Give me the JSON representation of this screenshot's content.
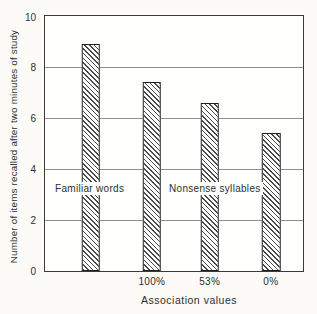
{
  "chart_data": {
    "type": "bar",
    "title": "",
    "xlabel": "Association values",
    "ylabel": "Number of items recalled after two minutes of study",
    "ylim": [
      0,
      10
    ],
    "yticks": [
      0,
      2,
      4,
      6,
      8,
      10
    ],
    "gridlines": [
      2,
      4,
      6,
      8
    ],
    "grid": "horizontal",
    "legend": "none",
    "bars": [
      {
        "group": "Familiar words",
        "x_tick_label": "",
        "value": 8.9
      },
      {
        "group": "Nonsense syllables",
        "x_tick_label": "100%",
        "value": 7.4
      },
      {
        "group": "Nonsense syllables",
        "x_tick_label": "53%",
        "value": 6.6
      },
      {
        "group": "Nonsense syllables",
        "x_tick_label": "0%",
        "value": 5.4
      }
    ],
    "annotations": [
      {
        "text": "Familiar words"
      },
      {
        "text": "Nonsense syllables"
      }
    ],
    "bar_style": {
      "fill": "#ffffff",
      "hatch": "diagonal-down",
      "hatch_color": "#4a4a4a",
      "border_color": "#1f1f1f"
    }
  },
  "colors": {
    "background": "#fcfbf8",
    "ink": "#2e2e2e",
    "gridline": "#8e8e8e",
    "axis_border": "#3b3b3b"
  }
}
